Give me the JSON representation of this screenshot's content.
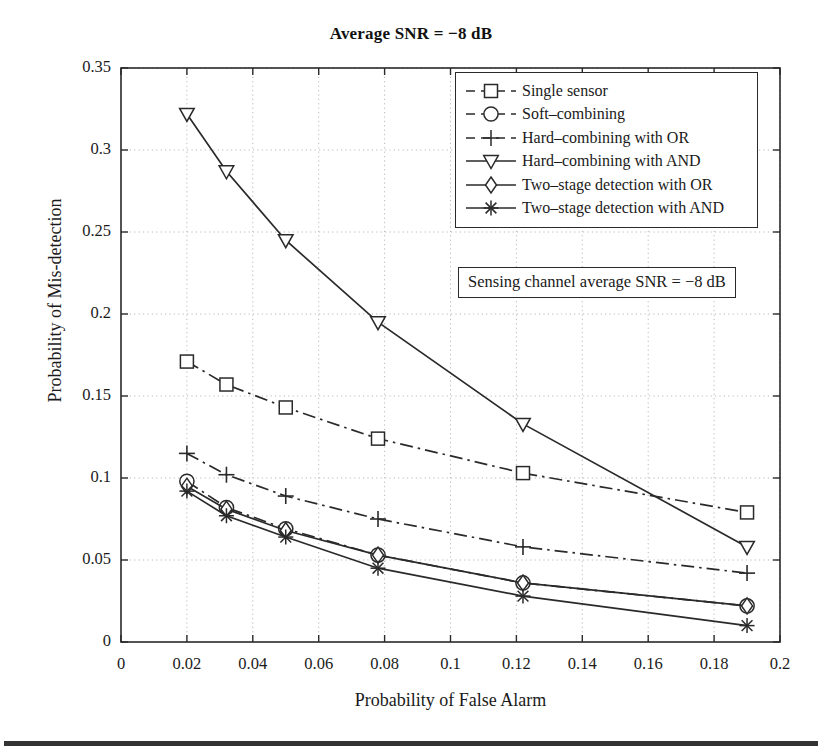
{
  "figure": {
    "title": "Average SNR = −8 dB",
    "annotation": "Sensing channel average SNR = −8 dB"
  },
  "axes": {
    "xlabel": "Probability of False Alarm",
    "ylabel": "Probability of Mis-detection",
    "x_ticks": [
      "0",
      "0.02",
      "0.04",
      "0.06",
      "0.08",
      "0.1",
      "0.12",
      "0.14",
      "0.16",
      "0.18",
      "0.2"
    ],
    "y_ticks": [
      "0",
      "0.05",
      "0.1",
      "0.15",
      "0.2",
      "0.25",
      "0.3",
      "0.35"
    ]
  },
  "legend": {
    "items": [
      {
        "label": "Single sensor",
        "marker": "square-marker",
        "style": "dash-dot"
      },
      {
        "label": "Soft–combining",
        "marker": "circle-marker",
        "style": "dash-dot"
      },
      {
        "label": "Hard–combining with OR",
        "marker": "plus-marker",
        "style": "dash-dot"
      },
      {
        "label": "Hard–combining with AND",
        "marker": "triangle-down-marker",
        "style": "solid"
      },
      {
        "label": "Two–stage detection with OR",
        "marker": "diamond-marker",
        "style": "solid"
      },
      {
        "label": "Two–stage detection with AND",
        "marker": "asterisk-marker",
        "style": "solid"
      }
    ]
  },
  "chart_data": {
    "type": "line",
    "title": "Average SNR = −8 dB",
    "xlabel": "Probability of False Alarm",
    "ylabel": "Probability of Mis-detection",
    "xlim": [
      0,
      0.2
    ],
    "ylim": [
      0,
      0.35
    ],
    "xticks": [
      0,
      0.02,
      0.04,
      0.06,
      0.08,
      0.1,
      0.12,
      0.14,
      0.16,
      0.18,
      0.2
    ],
    "yticks": [
      0,
      0.05,
      0.1,
      0.15,
      0.2,
      0.25,
      0.3,
      0.35
    ],
    "grid": true,
    "legend_position": "upper-right",
    "annotation": "Sensing channel average SNR = −8 dB",
    "line_color": "#2a2a2a",
    "series": [
      {
        "name": "Single sensor",
        "marker": "square",
        "linestyle": "dash-dot",
        "x": [
          0.02,
          0.032,
          0.05,
          0.078,
          0.122,
          0.19
        ],
        "y": [
          0.171,
          0.157,
          0.143,
          0.124,
          0.103,
          0.079
        ]
      },
      {
        "name": "Soft–combining",
        "marker": "circle",
        "linestyle": "dash-dot",
        "x": [
          0.02,
          0.032,
          0.05,
          0.078,
          0.122,
          0.19
        ],
        "y": [
          0.098,
          0.082,
          0.069,
          0.053,
          0.036,
          0.022
        ]
      },
      {
        "name": "Hard–combining with OR",
        "marker": "plus",
        "linestyle": "dash-dot",
        "x": [
          0.02,
          0.032,
          0.05,
          0.078,
          0.122,
          0.19
        ],
        "y": [
          0.115,
          0.102,
          0.089,
          0.075,
          0.058,
          0.042
        ]
      },
      {
        "name": "Hard–combining with AND",
        "marker": "triangle-down",
        "linestyle": "solid",
        "x": [
          0.02,
          0.032,
          0.05,
          0.078,
          0.122,
          0.19
        ],
        "y": [
          0.322,
          0.287,
          0.245,
          0.195,
          0.133,
          0.058
        ]
      },
      {
        "name": "Two–stage detection with OR",
        "marker": "diamond",
        "linestyle": "solid",
        "x": [
          0.02,
          0.032,
          0.05,
          0.078,
          0.122,
          0.19
        ],
        "y": [
          0.095,
          0.081,
          0.068,
          0.053,
          0.036,
          0.022
        ]
      },
      {
        "name": "Two–stage detection with AND",
        "marker": "asterisk",
        "linestyle": "solid",
        "x": [
          0.02,
          0.032,
          0.05,
          0.078,
          0.122,
          0.19
        ],
        "y": [
          0.092,
          0.077,
          0.064,
          0.045,
          0.028,
          0.01
        ]
      }
    ]
  }
}
